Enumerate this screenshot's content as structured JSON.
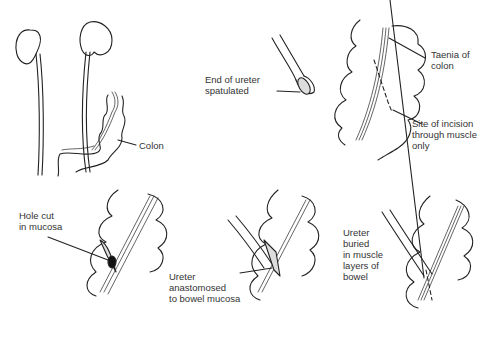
{
  "figure": {
    "panels": [
      {
        "id": "kidneys-colon",
        "labels": [
          {
            "key": "colon",
            "text": "Colon"
          }
        ]
      },
      {
        "id": "ureter-end",
        "labels": [
          {
            "key": "spatulated",
            "text": "End of ureter\nspatulated"
          }
        ]
      },
      {
        "id": "colon-incision",
        "labels": [
          {
            "key": "taenia",
            "text": "Taenia of\ncolon"
          },
          {
            "key": "incision",
            "text": "Site of incision\nthrough muscle\nonly"
          }
        ]
      },
      {
        "id": "hole-mucosa",
        "labels": [
          {
            "key": "hole",
            "text": "Hole cut\nin mucosa"
          }
        ]
      },
      {
        "id": "anastomosis",
        "labels": [
          {
            "key": "anastomosed",
            "text": "Ureter\nanastomosed\nto bowel mucosa"
          }
        ]
      },
      {
        "id": "buried",
        "labels": [
          {
            "key": "buried",
            "text": "Ureter\nburied\nin muscle\nlayers of\nbowel"
          }
        ]
      }
    ]
  },
  "labels": {
    "colon": "Colon",
    "spatulated": "End of ureter\nspatulated",
    "taenia": "Taenia of\ncolon",
    "incision": "Site of incision\nthrough muscle\nonly",
    "hole": "Hole cut\nin mucosa",
    "anastomosed": "Ureter\nanastomosed\nto bowel mucosa",
    "buried": "Ureter\nburied\nin muscle\nlayers of\nbowel"
  }
}
